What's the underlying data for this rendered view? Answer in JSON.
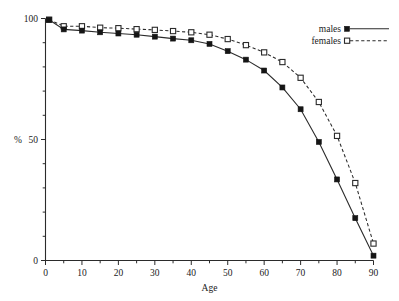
{
  "chart_data": {
    "type": "line",
    "title": "",
    "xlabel": "Age",
    "ylabel": "%",
    "xlim": [
      0,
      90
    ],
    "ylim": [
      0,
      100
    ],
    "grid": false,
    "legend_position": "top-right",
    "x_ticks": [
      0,
      10,
      20,
      30,
      40,
      50,
      60,
      70,
      80,
      90
    ],
    "x_tick_labels": [
      "0",
      "10",
      "20",
      "30",
      "40",
      "50",
      "60",
      "70",
      "80",
      "90"
    ],
    "x_minor_ticks": [
      5,
      15,
      25,
      35,
      45,
      55,
      65,
      75,
      85
    ],
    "y_ticks": [
      0,
      50,
      100
    ],
    "y_tick_labels": [
      "0",
      "50",
      "100"
    ],
    "y_minor_ticks": [
      10,
      20,
      30,
      40,
      60,
      70,
      80,
      90
    ],
    "x": [
      1,
      5,
      10,
      15,
      20,
      25,
      30,
      35,
      40,
      45,
      50,
      55,
      60,
      65,
      70,
      75,
      80,
      85,
      90
    ],
    "series": [
      {
        "name": "males",
        "marker": "filled-square",
        "line": "solid",
        "color": "#151515",
        "values": [
          99.5,
          95.5,
          95.0,
          94.3,
          93.8,
          93.3,
          92.5,
          91.7,
          91.0,
          89.5,
          86.5,
          83.0,
          78.5,
          71.5,
          62.5,
          49.0,
          33.5,
          17.5,
          2.0
        ]
      },
      {
        "name": "females",
        "marker": "open-square",
        "line": "dashed",
        "color": "#2b2b2b",
        "values": [
          99.5,
          96.8,
          96.8,
          96.2,
          96.0,
          95.6,
          95.3,
          94.8,
          94.3,
          93.3,
          91.5,
          89.0,
          86.0,
          82.0,
          75.5,
          65.5,
          51.5,
          32.0,
          7.0
        ]
      }
    ]
  },
  "legend": {
    "items": [
      {
        "label": "males"
      },
      {
        "label": "females"
      }
    ]
  },
  "axes": {
    "x_title": "Age",
    "y_title": "%"
  }
}
